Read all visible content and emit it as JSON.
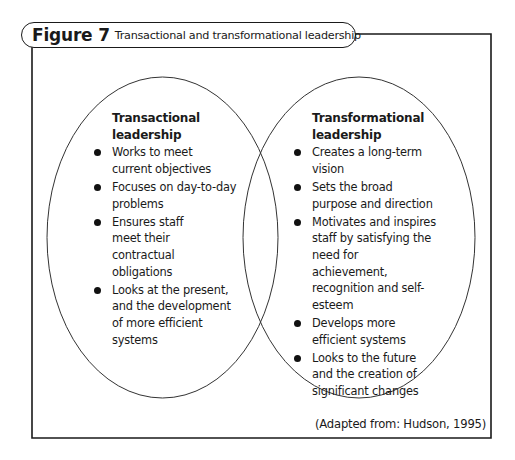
{
  "figure": {
    "label": "Figure 7",
    "title": "Transactional and transformational leadership"
  },
  "left_circle": {
    "heading": [
      "Transactional",
      "leadership"
    ],
    "items": [
      "Works to meet current objectives",
      "Focuses on day-to-day problems",
      "Ensures staff meet their contractual obligations",
      "Looks at the present, and the development of more efficient systems"
    ]
  },
  "right_circle": {
    "heading": [
      "Transformational",
      "leadership"
    ],
    "items": [
      "Creates a long-term vision",
      "Sets the broad purpose and direction",
      "Motivates and inspires staff by satisfying the need for achievement, recognition and self-esteem",
      "Develops more efficient systems",
      "Looks to the future and the creation of significant changes"
    ]
  },
  "caption": "(Adapted from: Hudson, 1995)",
  "colors": {
    "stroke": "#1a1a1a",
    "background": "#ffffff"
  }
}
